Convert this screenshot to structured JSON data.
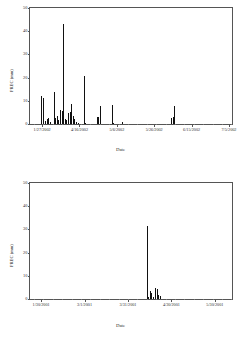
{
  "figure": {
    "panels": [
      "top",
      "bottom"
    ]
  },
  "chart_data": [
    {
      "type": "bar",
      "title": "",
      "annotation": "2002",
      "xlabel": "Date",
      "ylabel": "PREC (mm)",
      "ylim": [
        0,
        50
      ],
      "yticks": [
        0,
        10,
        20,
        30,
        40,
        50
      ],
      "ytick_labels": [
        "0",
        "10",
        "20",
        "30",
        "40",
        "50"
      ],
      "xtick_labels": [
        "1/27/2002",
        "4/16/2002",
        "5/6/2002",
        "5/26/2002",
        "6/15/2002",
        "7/5/2002"
      ],
      "xtick_positions": [
        0.06,
        0.245,
        0.43,
        0.615,
        0.8,
        0.985
      ],
      "grid": false,
      "legend": null,
      "x": [
        0.055,
        0.062,
        0.072,
        0.082,
        0.09,
        0.098,
        0.118,
        0.125,
        0.132,
        0.14,
        0.148,
        0.156,
        0.164,
        0.172,
        0.18,
        0.188,
        0.196,
        0.204,
        0.212,
        0.22,
        0.228,
        0.236,
        0.265,
        0.272,
        0.33,
        0.338,
        0.346,
        0.405,
        0.412,
        0.455,
        0.7,
        0.707,
        0.714
      ],
      "values": [
        12.0,
        11.0,
        1.2,
        2.0,
        2.6,
        0.8,
        13.5,
        2.5,
        3.2,
        1.5,
        6.0,
        5.5,
        42.5,
        2.2,
        1.8,
        4.5,
        5.0,
        8.5,
        3.5,
        2.0,
        1.0,
        0.6,
        20.3,
        0.5,
        2.8,
        3.0,
        7.5,
        8.2,
        0.5,
        1.0,
        2.5,
        3.0,
        7.6
      ]
    },
    {
      "type": "bar",
      "title": "",
      "annotation": "2001",
      "xlabel": "Date",
      "ylabel": "PREC (mm)",
      "ylim": [
        0,
        50
      ],
      "yticks": [
        0,
        10,
        20,
        30,
        40,
        50
      ],
      "ytick_labels": [
        "0",
        "10",
        "20",
        "30",
        "40",
        "50"
      ],
      "xtick_labels": [
        "1/30/2001",
        "3/1/2001",
        "3/31/2001",
        "4/30/2001",
        "5/30/2001"
      ],
      "xtick_positions": [
        0.055,
        0.27,
        0.485,
        0.7,
        0.915
      ],
      "grid": false,
      "legend": null,
      "x": [
        0.578,
        0.585,
        0.592,
        0.6,
        0.608,
        0.62,
        0.628,
        0.636,
        0.646
      ],
      "values": [
        31.0,
        1.0,
        3.6,
        2.4,
        0.8,
        4.6,
        4.4,
        1.6,
        1.4
      ]
    }
  ]
}
